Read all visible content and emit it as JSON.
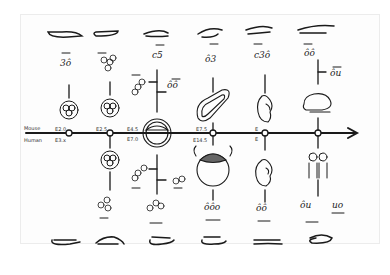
{
  "diagram": {
    "type": "hand-drawn timeline sketch",
    "axis": {
      "top_label": "Mouse",
      "bottom_label": "Human",
      "arrow_direction": "right"
    },
    "stages": [
      {
        "mouse_label": "E2.0",
        "human_label": "E3.x",
        "top_glyph": "3ô",
        "bottom_glyph": "3ô"
      },
      {
        "mouse_label": "E2.5",
        "human_label": "",
        "top_glyph": "3ô3",
        "bottom_glyph": "3ô3"
      },
      {
        "mouse_label": "E4.5",
        "human_label": "E7.0",
        "top_glyph": "c5",
        "top_side_left": "3ô",
        "top_side_right": "ôô",
        "bottom_side_left": "3ô",
        "bottom_side_right": "ôô",
        "bottom_glyph": "ôôô"
      },
      {
        "mouse_label": "E7.5",
        "human_label": "E14.5",
        "top_glyph": "ô3",
        "bottom_glyph": "ôôo"
      },
      {
        "mouse_label": "E",
        "human_label": "E",
        "top_glyph": "c3ô",
        "bottom_glyph": "ôô"
      },
      {
        "mouse_label": "",
        "human_label": "",
        "top_glyph": "ôô",
        "top_side_right": "ôu",
        "bottom_glyph": "ôu",
        "bottom_side_right": "uo"
      }
    ]
  }
}
